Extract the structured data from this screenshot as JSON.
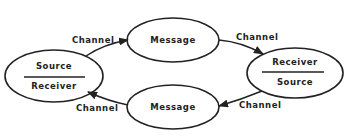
{
  "diagram": {
    "type": "communication-cycle",
    "nodes": [
      {
        "id": "left",
        "top_label": "Source",
        "bottom_label": "Receiver"
      },
      {
        "id": "message-top",
        "label": "Message"
      },
      {
        "id": "right",
        "top_label": "Receiver",
        "bottom_label": "Source"
      },
      {
        "id": "message-bottom",
        "label": "Message"
      }
    ],
    "edges": [
      {
        "from": "left",
        "to": "message-top",
        "label": "Channel"
      },
      {
        "from": "message-top",
        "to": "right",
        "label": "Channel"
      },
      {
        "from": "right",
        "to": "message-bottom",
        "label": "Channel"
      },
      {
        "from": "message-bottom",
        "to": "left",
        "label": "Channel"
      }
    ],
    "stroke_color": "#222222",
    "background": "#ffffff"
  }
}
